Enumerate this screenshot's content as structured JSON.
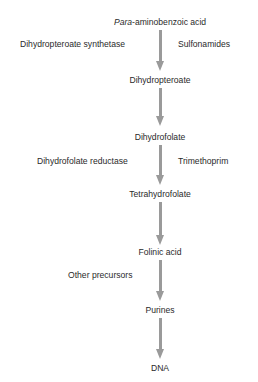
{
  "diagram": {
    "nodes": [
      {
        "id": "paba",
        "prefix_italic": "Para",
        "label": "-aminobenzoic acid"
      },
      {
        "id": "dihydropteroate",
        "label": "Dihydropteroate"
      },
      {
        "id": "dihydrofolate",
        "label": "Dihydrofolate"
      },
      {
        "id": "tetrahydrofolate",
        "label": "Tetrahydrofolate"
      },
      {
        "id": "folinic-acid",
        "label": "Folinic acid"
      },
      {
        "id": "purines",
        "label": "Purines"
      },
      {
        "id": "dna",
        "label": "DNA"
      }
    ],
    "edges": [
      {
        "from": "paba",
        "to": "dihydropteroate",
        "enzyme": "Dihydropteroate synthetase",
        "inhibitor": "Sulfonamides"
      },
      {
        "from": "dihydropteroate",
        "to": "dihydrofolate"
      },
      {
        "from": "dihydrofolate",
        "to": "tetrahydrofolate",
        "enzyme": "Dihydrofolate reductase",
        "inhibitor": "Trimethoprim"
      },
      {
        "from": "tetrahydrofolate",
        "to": "folinic-acid"
      },
      {
        "from": "folinic-acid",
        "to": "purines",
        "input": "Other precursors"
      },
      {
        "from": "purines",
        "to": "dna"
      }
    ],
    "colors": {
      "arrow": "#9a9a9a",
      "text": "#2a2a2a",
      "background": "#ffffff"
    }
  }
}
